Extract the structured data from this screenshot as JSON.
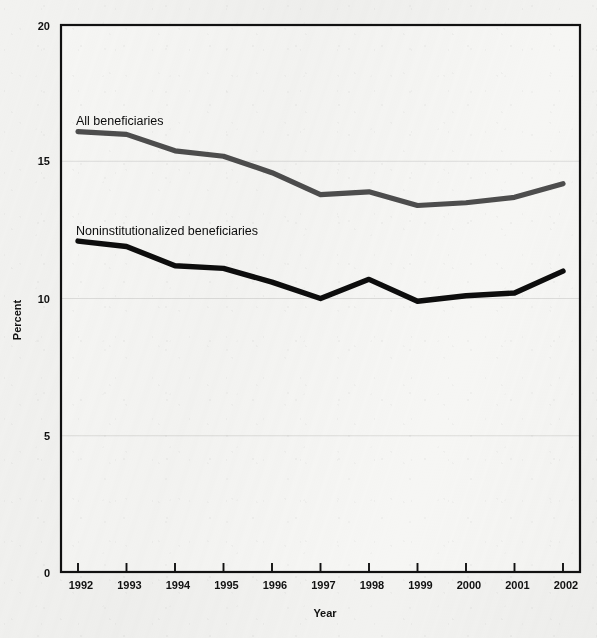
{
  "chart_data": {
    "type": "line",
    "title": "",
    "subtitle": "",
    "xlabel": "Year",
    "ylabel": "Percent",
    "categories": [
      "1992",
      "1993",
      "1994",
      "1995",
      "1996",
      "1997",
      "1998",
      "1999",
      "2000",
      "2001",
      "2002"
    ],
    "x": [
      1992,
      1993,
      1994,
      1995,
      1996,
      1997,
      1998,
      1999,
      2000,
      2001,
      2002
    ],
    "xlim": [
      1992,
      2002
    ],
    "ylim": [
      0,
      20
    ],
    "yticks": [
      0,
      5,
      10,
      15,
      20
    ],
    "ytick_labels": [
      "0",
      "5",
      "10",
      "15",
      "20"
    ],
    "grid": "horizontal-minor-light",
    "legend": "inline-labels",
    "series": [
      {
        "name": "All beneficiaries",
        "color": "#4d4d4d",
        "values": [
          16.1,
          16.0,
          15.4,
          15.2,
          14.6,
          13.8,
          13.9,
          13.4,
          13.5,
          13.7,
          14.2
        ]
      },
      {
        "name": "Noninstitutionalized beneficiaries",
        "color": "#0d0d0d",
        "values": [
          12.1,
          11.9,
          11.2,
          11.1,
          10.6,
          10.0,
          10.7,
          9.9,
          10.1,
          10.2,
          11.0
        ]
      }
    ],
    "annotations": [
      {
        "text": "All beneficiaries",
        "x": 1992,
        "y": 17.4
      },
      {
        "text": "Noninstitutionalized beneficiaries",
        "x": 1992,
        "y": 13.4
      }
    ]
  },
  "axes": {
    "y_label": "Percent",
    "x_label": "Year",
    "y_ticks": [
      "20",
      "15",
      "10",
      "5",
      "0"
    ],
    "x_ticks": [
      "1992",
      "1993",
      "1994",
      "1995",
      "1996",
      "1997",
      "1998",
      "1999",
      "2000",
      "2001",
      "2002"
    ]
  },
  "series_labels": {
    "all": "All beneficiaries",
    "noninstitutionalized": "Noninstitutionalized beneficiaries"
  },
  "colors": {
    "series_all": "#4d4d4d",
    "series_noninstitutionalized": "#0d0d0d",
    "axis": "#111111",
    "gridline": "#d8d8d6",
    "background": "#f2f2f0"
  }
}
